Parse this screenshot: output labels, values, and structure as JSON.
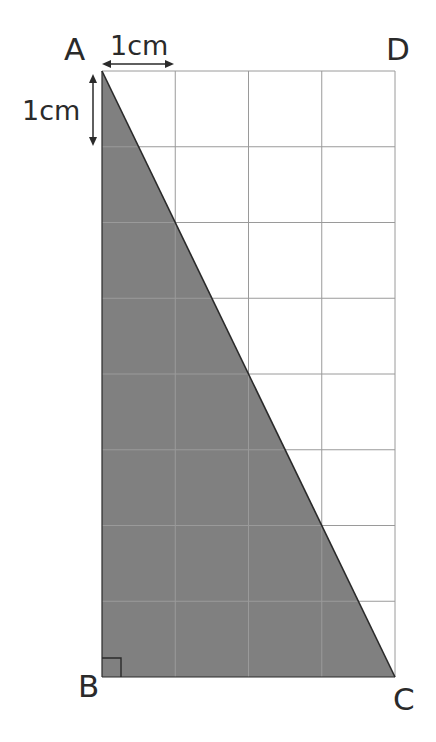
{
  "diagram": {
    "grid": {
      "columns": 4,
      "rows": 8,
      "unit": "cm",
      "line_color": "#9a9a9a"
    },
    "vertices": {
      "A": {
        "label": "A"
      },
      "B": {
        "label": "B"
      },
      "C": {
        "label": "C"
      },
      "D": {
        "label": "D"
      }
    },
    "shaded_region": {
      "shape": "triangle ABC",
      "fill": "#808080",
      "stroke": "#2a2a2a"
    },
    "right_angle_marker": {
      "at": "B"
    },
    "scale_labels": {
      "horizontal": "1cm",
      "vertical": "1cm"
    }
  }
}
